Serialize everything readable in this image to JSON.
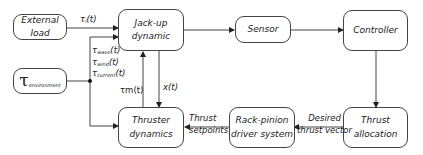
{
  "diagram": {
    "blocks": {
      "external_load": "External load",
      "environment_symbol": "τ",
      "environment_sub": "environment",
      "jackup_line1": "Jack-up",
      "jackup_line2": "dynamic",
      "sensor": "Sensor",
      "controller": "Controller",
      "thrust_alloc_line1": "Thrust",
      "thrust_alloc_line2": "allocation",
      "rackpinion_line1": "Rack-pinion",
      "rackpinion_line2": "driver system",
      "thruster_line1": "Thruster",
      "thruster_line2": "dynamics"
    },
    "signals": {
      "tau_l": "τ",
      "tau_l_sub": "l",
      "tau_l_arg": "(t)",
      "tau_wave": "τ",
      "tau_wave_sub": "wave",
      "tau_wind": "τ",
      "tau_wind_sub": "wind",
      "tau_current": "τ",
      "tau_current_sub": "current",
      "arg_t": "(t)",
      "tau_m": "τm(t)",
      "x_t": "x(t)",
      "thrust_setpoints_1": "Thrust",
      "thrust_setpoints_2": "setpoints",
      "desired_thrust_1": "Desired",
      "desired_thrust_2": "thrust vector"
    }
  }
}
